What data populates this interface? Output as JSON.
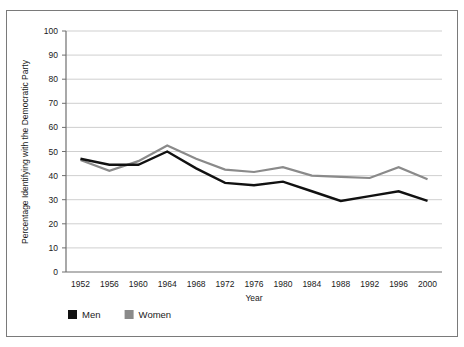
{
  "chart_data": {
    "type": "line",
    "title": "",
    "xlabel": "Year",
    "ylabel": "Percentage Identifying with the Democratic Party",
    "categories": [
      "1952",
      "1956",
      "1960",
      "1964",
      "1968",
      "1972",
      "1976",
      "1980",
      "1984",
      "1988",
      "1992",
      "1996",
      "2000"
    ],
    "x": [
      1952,
      1956,
      1960,
      1964,
      1968,
      1972,
      1976,
      1980,
      1984,
      1988,
      1992,
      1996,
      2000
    ],
    "series": [
      {
        "name": "Men",
        "color": "#111111",
        "values": [
          47,
          44.5,
          44.5,
          50,
          43,
          37,
          36,
          37.5,
          33.5,
          29.5,
          31.5,
          33.5,
          29.5
        ]
      },
      {
        "name": "Women",
        "color": "#8a8a8a",
        "values": [
          46.5,
          42,
          46,
          52.5,
          47,
          42.5,
          41.5,
          43.5,
          40,
          39.5,
          39,
          43.5,
          38.5
        ]
      }
    ],
    "ylim": [
      0,
      100
    ],
    "yticks": [
      0,
      10,
      20,
      30,
      40,
      50,
      60,
      70,
      80,
      90,
      100
    ],
    "yticklabels": [
      "0",
      "10",
      "20",
      "30",
      "40",
      "50",
      "60",
      "70",
      "80",
      "90",
      "100"
    ],
    "grid": "horizontal",
    "legend_position": "bottom-left",
    "legend": [
      "Men",
      "Women"
    ]
  },
  "legend": {
    "items": [
      {
        "label": "Men",
        "swatch_color": "#111111",
        "swatch_name": "legend-swatch-men"
      },
      {
        "label": "Women",
        "swatch_color": "#8a8a8a",
        "swatch_name": "legend-swatch-women"
      }
    ]
  },
  "axes": {
    "x_title": "Year",
    "y_title": "Percentage Identifying with the Democratic Party"
  },
  "colors": {
    "men_line": "#111111",
    "women_line": "#8a8a8a",
    "gridline": "#c9c9c9",
    "axis": "#6f6f6f",
    "frame": "#7a7a7a",
    "text": "#1a1a1a",
    "background": "#ffffff"
  }
}
